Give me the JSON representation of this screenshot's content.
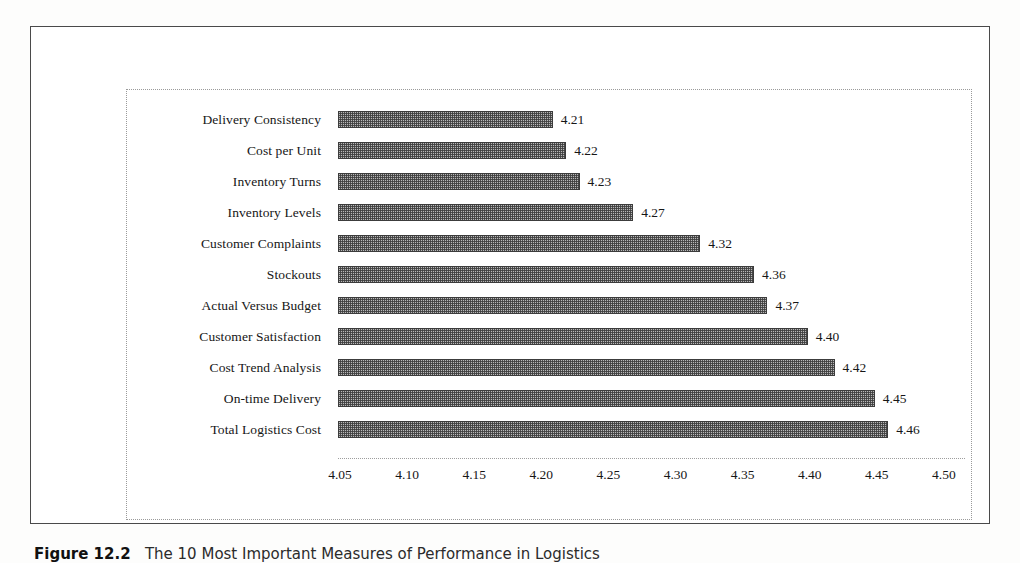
{
  "figure": {
    "caption_label": "Figure 12.2",
    "caption_text": "The 10 Most Important Measures of Performance in Logistics"
  },
  "chart_data": {
    "type": "bar",
    "orientation": "horizontal",
    "title": "",
    "xlabel": "",
    "ylabel": "",
    "xlim": [
      4.05,
      4.5
    ],
    "grid": false,
    "legend": "none",
    "xticks": [
      "4.05",
      "4.10",
      "4.15",
      "4.20",
      "4.25",
      "4.30",
      "4.35",
      "4.40",
      "4.45",
      "4.50"
    ],
    "xtick_values": [
      4.05,
      4.1,
      4.15,
      4.2,
      4.25,
      4.3,
      4.35,
      4.4,
      4.45,
      4.5
    ],
    "categories": [
      "Delivery Consistency",
      "Cost per Unit",
      "Inventory Turns",
      "Inventory Levels",
      "Customer Complaints",
      "Stockouts",
      "Actual Versus Budget",
      "Customer Satisfaction",
      "Cost Trend Analysis",
      "On-time Delivery",
      "Total Logistics Cost"
    ],
    "values": [
      4.21,
      4.22,
      4.23,
      4.27,
      4.32,
      4.36,
      4.37,
      4.4,
      4.42,
      4.45,
      4.46
    ],
    "value_labels": [
      "4.21",
      "4.22",
      "4.23",
      "4.27",
      "4.32",
      "4.36",
      "4.37",
      "4.40",
      "4.42",
      "4.45",
      "4.46"
    ],
    "bar_fill": "#b8b8b8",
    "bar_edge": "#3c3c3c"
  }
}
